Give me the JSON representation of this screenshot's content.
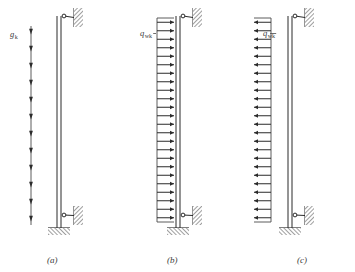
{
  "figure": {
    "background": "#ffffff",
    "ink": "#4a4a4a",
    "ink_dark": "#2b2b2b",
    "hatch_color": "#6b6b6b"
  },
  "panels": [
    {
      "id": "a",
      "caption": "(a)",
      "caption_x": 47,
      "caption_y": 263,
      "load": {
        "symbol": "g",
        "subscript": "k",
        "label_x": 10,
        "label_y": 37,
        "type": "vertical-gravity-load",
        "direction": "down",
        "line_x": 31,
        "line_top": 26,
        "line_bottom": 225,
        "arrow_count": 12,
        "arrow_len": 9
      },
      "column": {
        "x_left": 57,
        "x_right": 61,
        "top": 16,
        "bottom": 228
      },
      "supports": {
        "top_link": {
          "pin_x": 64,
          "pin_y": 16,
          "wall_x": 74,
          "wall_y": 8,
          "wall_w": 9,
          "wall_h": 19
        },
        "bottom_link": {
          "pin_x": 64,
          "pin_y": 215,
          "wall_x": 74,
          "wall_y": 206,
          "wall_w": 9,
          "wall_h": 19
        },
        "base": {
          "x": 48,
          "y": 228,
          "w": 22,
          "h": 7
        }
      }
    },
    {
      "id": "b",
      "caption": "(b)",
      "caption_x": 167,
      "caption_y": 263,
      "load": {
        "symbol": "q",
        "subscript": "wk",
        "label_x": 140,
        "label_y": 36,
        "type": "horizontal-distributed-load",
        "direction": "right",
        "line_x": 157,
        "line_top": 18,
        "line_bottom": 222,
        "arrow_count": 24,
        "arrow_len": 17
      },
      "column": {
        "x_left": 176,
        "x_right": 180,
        "top": 16,
        "bottom": 228
      },
      "supports": {
        "top_link": {
          "pin_x": 183,
          "pin_y": 16,
          "wall_x": 193,
          "wall_y": 8,
          "wall_w": 9,
          "wall_h": 19
        },
        "bottom_link": {
          "pin_x": 183,
          "pin_y": 215,
          "wall_x": 193,
          "wall_y": 206,
          "wall_w": 9,
          "wall_h": 19
        },
        "base": {
          "x": 167,
          "y": 228,
          "w": 22,
          "h": 7
        }
      }
    },
    {
      "id": "c",
      "caption": "(c)",
      "caption_x": 297,
      "caption_y": 263,
      "load": {
        "symbol": "q",
        "subscript": "wk",
        "label_x": 263,
        "label_y": 36,
        "type": "horizontal-distributed-load",
        "direction": "left",
        "line_x": 288,
        "line_top": 18,
        "line_bottom": 222,
        "arrow_count": 24,
        "arrow_len": 17
      },
      "column": {
        "x_left": 288,
        "x_right": 292,
        "top": 16,
        "bottom": 228
      },
      "supports": {
        "top_link": {
          "pin_x": 295,
          "pin_y": 16,
          "wall_x": 305,
          "wall_y": 8,
          "wall_w": 9,
          "wall_h": 19
        },
        "bottom_link": {
          "pin_x": 295,
          "pin_y": 215,
          "wall_x": 305,
          "wall_y": 206,
          "wall_w": 9,
          "wall_h": 19
        },
        "base": {
          "x": 279,
          "y": 228,
          "w": 22,
          "h": 7
        }
      }
    }
  ]
}
